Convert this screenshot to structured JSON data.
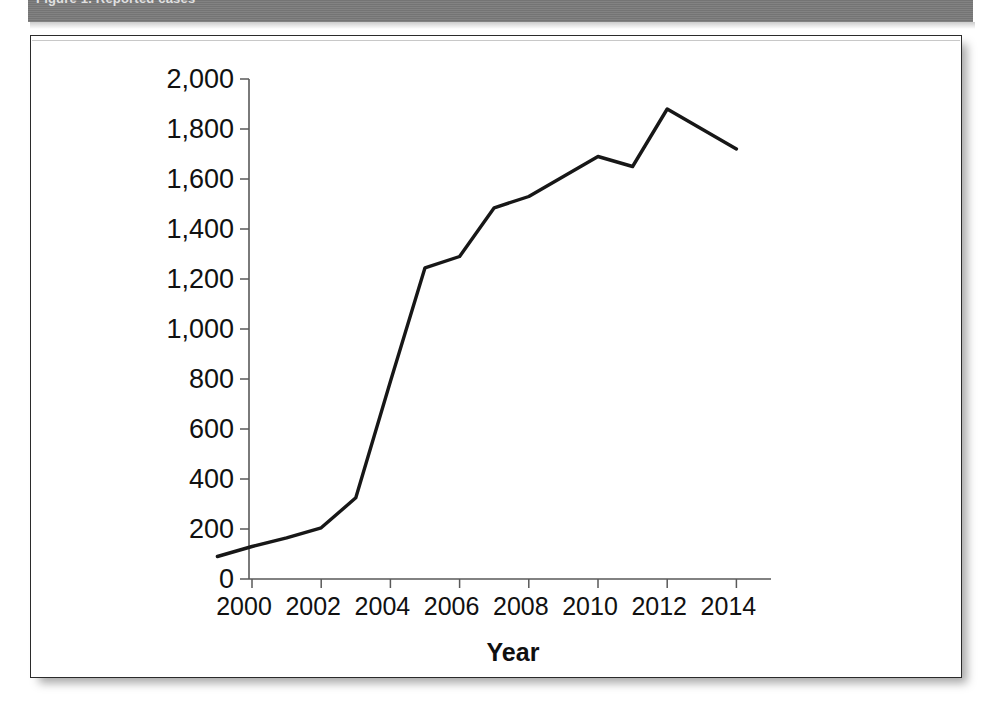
{
  "header": {
    "caption": "Figure 1. Reported cases",
    "band_color": "#7a7a7a"
  },
  "figure": {
    "background": "#ffffff",
    "border_color": "#2b2b2b"
  },
  "chart_data": {
    "type": "line",
    "title": "",
    "subtitle": "",
    "xlabel": "Year",
    "ylabel": "",
    "grid": false,
    "legend": "none",
    "line_color": "#171717",
    "xlim": [
      1999,
      2015
    ],
    "ylim": [
      0,
      2000
    ],
    "yticks": [
      0,
      200,
      400,
      600,
      800,
      1000,
      1200,
      1400,
      1600,
      1800,
      2000
    ],
    "ytick_labels": [
      "0",
      "200",
      "400",
      "600",
      "800",
      "1,000",
      "1,200",
      "1,400",
      "1,600",
      "1,800",
      "2,000"
    ],
    "xticks": [
      2000,
      2002,
      2004,
      2006,
      2008,
      2010,
      2012,
      2014
    ],
    "xtick_labels": [
      "2000",
      "2002",
      "2004",
      "2006",
      "2008",
      "2010",
      "2012",
      "2014"
    ],
    "x": [
      1999,
      2000,
      2001,
      2002,
      2003,
      2004,
      2005,
      2006,
      2007,
      2008,
      2009,
      2010,
      2011,
      2012,
      2013,
      2014
    ],
    "values": [
      90,
      130,
      165,
      205,
      325,
      790,
      1245,
      1290,
      1485,
      1530,
      1610,
      1690,
      1650,
      1880,
      1800,
      1720
    ],
    "series": [
      {
        "name": "Cases",
        "values": [
          90,
          130,
          165,
          205,
          325,
          790,
          1245,
          1290,
          1485,
          1530,
          1610,
          1690,
          1650,
          1880,
          1800,
          1720
        ]
      }
    ]
  }
}
